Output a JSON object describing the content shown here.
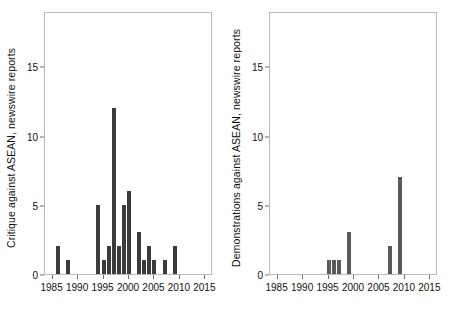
{
  "chart_data": [
    {
      "type": "bar",
      "panel": "left",
      "title": "",
      "xlabel": "",
      "ylabel": "Critique against ASEAN, newswire reports",
      "xlim": [
        1983.5,
        2016.5
      ],
      "ylim": [
        0,
        19
      ],
      "yticks": [
        0,
        5,
        10,
        15
      ],
      "xticks": [
        1985,
        1990,
        1995,
        2000,
        2005,
        2010,
        2015
      ],
      "grid": false,
      "legend": "none",
      "bar_color": "#3b3b3b",
      "categories": [
        1986,
        1988,
        1994,
        1995,
        1996,
        1997,
        1998,
        1999,
        2000,
        2002,
        2003,
        2004,
        2005,
        2007,
        2009
      ],
      "values": [
        2,
        1,
        5,
        1,
        2,
        12,
        2,
        5,
        6,
        3,
        1,
        2,
        1,
        1,
        2
      ]
    },
    {
      "type": "bar",
      "panel": "right",
      "title": "",
      "xlabel": "",
      "ylabel": "Demonstrations against ASEAN, newswire reports",
      "xlim": [
        1983.5,
        2016.5
      ],
      "ylim": [
        0,
        19
      ],
      "yticks": [
        0,
        5,
        10,
        15
      ],
      "xticks": [
        1985,
        1990,
        1995,
        2000,
        2005,
        2010,
        2015
      ],
      "grid": false,
      "legend": "none",
      "bar_color": "#5a5a5a",
      "categories": [
        1995,
        1996,
        1997,
        1999,
        2007,
        2009
      ],
      "values": [
        1,
        1,
        1,
        3,
        2,
        7
      ]
    }
  ],
  "left_panel": {
    "ylabel": "Critique against ASEAN, newswire reports",
    "yticks": [
      "0",
      "5",
      "10",
      "15"
    ],
    "xticks": [
      "1985",
      "1990",
      "1995",
      "2000",
      "2005",
      "2010",
      "2015"
    ]
  },
  "right_panel": {
    "ylabel": "Demonstrations against ASEAN, newswire reports",
    "yticks": [
      "0",
      "5",
      "10",
      "15"
    ],
    "xticks": [
      "1985",
      "1990",
      "1995",
      "2000",
      "2005",
      "2010",
      "2015"
    ]
  }
}
